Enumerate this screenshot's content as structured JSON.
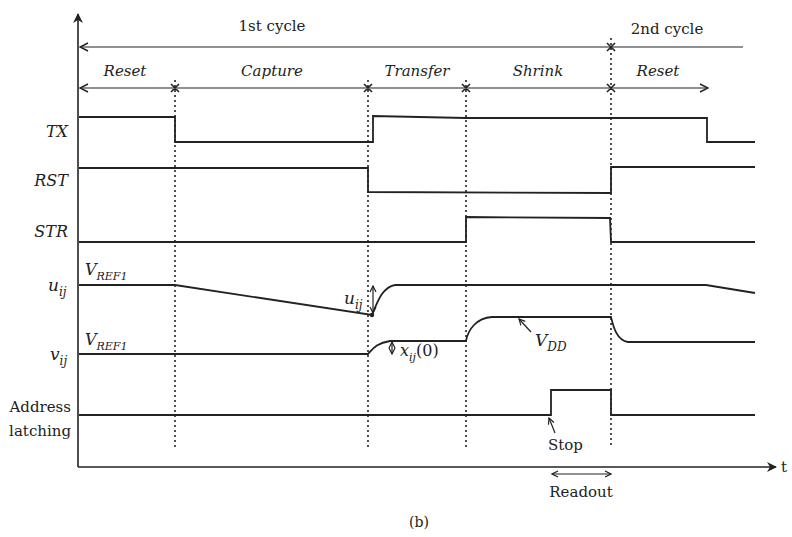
{
  "figure": {
    "caption": "(b)",
    "axis": {
      "time_label": "t"
    },
    "cycles": [
      {
        "label": "1st cycle"
      },
      {
        "label": "2nd cycle"
      }
    ],
    "phases": [
      {
        "label": "Reset"
      },
      {
        "label": "Capture"
      },
      {
        "label": "Transfer"
      },
      {
        "label": "Shrink"
      },
      {
        "label": "Reset"
      }
    ],
    "signals": [
      {
        "name": "TX"
      },
      {
        "name": "RST"
      },
      {
        "name": "STR"
      },
      {
        "name": "u",
        "subscript": "ij",
        "level_label": "V",
        "level_sub": "REF1"
      },
      {
        "name": "v",
        "subscript": "ij",
        "level_label": "V",
        "level_sub": "REF1"
      },
      {
        "name_line1": "Address",
        "name_line2": "latching"
      }
    ],
    "annotations": {
      "u_delta": {
        "main": "u",
        "sub": "ij"
      },
      "x_initial": {
        "main": "x",
        "sub": "ij",
        "suffix": "(0)"
      },
      "vdd": {
        "main": "V",
        "sub": "DD"
      },
      "stop": "Stop",
      "readout": "Readout"
    }
  }
}
